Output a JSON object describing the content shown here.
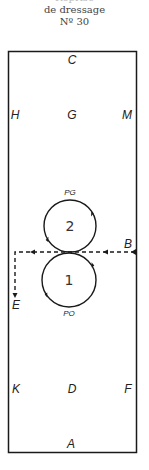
{
  "caption": {
    "line0": "Reprise",
    "line1": "de dressage",
    "line2": "Nº 30"
  },
  "arena": {
    "letters": {
      "C": "C",
      "H": "H",
      "G": "G",
      "M": "M",
      "B": "B",
      "E": "E",
      "K": "K",
      "D": "D",
      "F": "F",
      "A": "A"
    }
  },
  "figure": {
    "circle_top": {
      "number": "2",
      "label": "PG",
      "direction": "clockwise"
    },
    "circle_bottom": {
      "number": "1",
      "label": "PO",
      "direction": "counterclockwise"
    },
    "path": {
      "from": "B",
      "to": "E",
      "style": "dashed"
    }
  },
  "colors": {
    "line": "#1a1a1a",
    "background": "#ffffff"
  }
}
